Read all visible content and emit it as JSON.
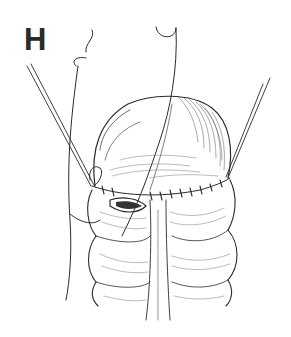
{
  "figure": {
    "panel_label": "H",
    "colors": {
      "ink": "#2a2a2a",
      "background": "#ffffff",
      "shade": "#555555"
    }
  }
}
